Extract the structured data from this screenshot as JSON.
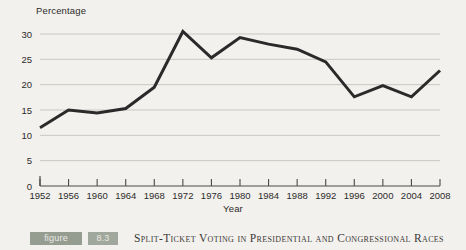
{
  "chart_data": {
    "type": "line",
    "title": "",
    "xlabel": "Year",
    "ylabel": "Percentage",
    "ylim": [
      0,
      30
    ],
    "yticks": [
      0,
      5,
      10,
      15,
      20,
      25,
      30
    ],
    "grid": true,
    "legend": "none",
    "line_color": "#2a2a2a",
    "x": [
      1952,
      1956,
      1960,
      1964,
      1968,
      1972,
      1976,
      1980,
      1984,
      1988,
      1992,
      1996,
      2000,
      2004,
      2008
    ],
    "categories": [
      "1952",
      "1956",
      "1960",
      "1964",
      "1968",
      "1972",
      "1976",
      "1980",
      "1984",
      "1988",
      "1992",
      "1996",
      "2000",
      "2004",
      "2008"
    ],
    "values": [
      11.5,
      15.0,
      14.4,
      15.3,
      19.5,
      30.5,
      25.3,
      29.3,
      28.0,
      27.0,
      24.5,
      17.6,
      19.8,
      17.6,
      22.8
    ],
    "series": [
      {
        "name": "Split-ticket voting",
        "values": [
          11.5,
          15.0,
          14.4,
          15.3,
          19.5,
          30.5,
          25.3,
          29.3,
          28.0,
          27.0,
          24.5,
          17.6,
          19.8,
          17.6,
          22.8
        ]
      }
    ]
  },
  "axes": {
    "y_title": "Percentage",
    "x_title": "Year",
    "y_tick_labels": [
      "0",
      "5",
      "10",
      "15",
      "20",
      "25",
      "30"
    ],
    "x_tick_labels": [
      "1952",
      "1956",
      "1960",
      "1964",
      "1968",
      "1972",
      "1976",
      "1980",
      "1984",
      "1988",
      "1992",
      "1996",
      "2000",
      "2004",
      "2008"
    ]
  },
  "caption": {
    "figure_word": "figure",
    "figure_number": "8.3",
    "text": "Split-Ticket Voting in Presidential and Congressional Races"
  },
  "colors": {
    "background": "#f3f1ed",
    "line": "#2a2a2a",
    "gridline": "#c9c7c2",
    "axis": "#4a4a48",
    "badge_word": "#8e978b",
    "badge_number": "#9aa296",
    "caption_text": "#3b3a38"
  }
}
